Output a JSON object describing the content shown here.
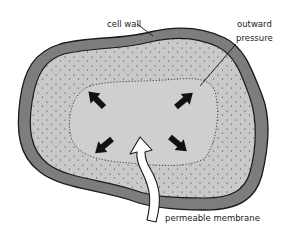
{
  "diagram": {
    "labels": {
      "cell_wall": "cell wall",
      "outward_line1": "outward",
      "outward_line2": "pressure",
      "permeable_membrane": "permeable membrane"
    },
    "colors": {
      "cell_wall": "#7d7d7d",
      "cytoplasm": "#c9c9c9",
      "vacuole": "#cfcfcf",
      "outline": "#1a1a1a",
      "arrows": "#111111",
      "inflow_arrow": "#ffffff",
      "background": "#ffffff"
    },
    "arrows": [
      {
        "direction": "up-left"
      },
      {
        "direction": "up-right"
      },
      {
        "direction": "down-left"
      },
      {
        "direction": "down-right"
      }
    ],
    "inflow_arrow": {
      "direction": "up",
      "meaning": "water entering through membrane"
    }
  }
}
